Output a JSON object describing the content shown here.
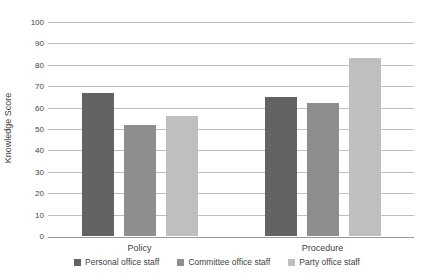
{
  "chart_data": {
    "type": "bar",
    "title": "",
    "xlabel": "",
    "ylabel": "Knowledge Score",
    "categories": [
      "Policy",
      "Procedure"
    ],
    "series": [
      {
        "name": "Personal office staff",
        "color": "#636363",
        "values": [
          67,
          65
        ]
      },
      {
        "name": "Committee office staff",
        "color": "#8e8e8e",
        "values": [
          52,
          62
        ]
      },
      {
        "name": "Party office staff",
        "color": "#bfbfbf",
        "values": [
          56,
          83
        ]
      }
    ],
    "ylim": [
      0,
      100
    ],
    "ytick_step": 10,
    "grid": true,
    "legend_position": "bottom"
  },
  "colors": {
    "gridline": "#bfbfbf",
    "axis_line": "#9a9a9a",
    "text": "#3f3f3f",
    "background": "#ffffff"
  }
}
